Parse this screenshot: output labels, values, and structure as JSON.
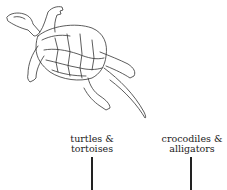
{
  "diagram": {
    "type": "phylogenetic-tree-fragment",
    "illustration": "turtle-drawing",
    "taxa": [
      {
        "line1": "turtles &",
        "line2": "tortoises"
      },
      {
        "line1": "crocodiles &",
        "line2": "alligators"
      }
    ],
    "colors": {
      "line": "#222222",
      "background": "#ffffff"
    }
  }
}
